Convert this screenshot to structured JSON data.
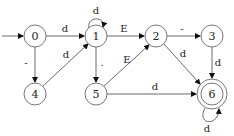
{
  "diagram": {
    "type": "finite-state-automaton",
    "start_state": "0",
    "accepting_states": [
      "6"
    ],
    "nodes": [
      {
        "id": "0",
        "label": "0",
        "x": 35,
        "y": 36
      },
      {
        "id": "1",
        "label": "1",
        "x": 96,
        "y": 36
      },
      {
        "id": "2",
        "label": "2",
        "x": 156,
        "y": 36
      },
      {
        "id": "3",
        "label": "3",
        "x": 212,
        "y": 36
      },
      {
        "id": "4",
        "label": "4",
        "x": 35,
        "y": 94
      },
      {
        "id": "5",
        "label": "5",
        "x": 96,
        "y": 94
      },
      {
        "id": "6",
        "label": "6",
        "x": 212,
        "y": 94
      }
    ],
    "edges": [
      {
        "from": "0",
        "to": "1",
        "label": "d"
      },
      {
        "from": "0",
        "to": "4",
        "label": "-"
      },
      {
        "from": "4",
        "to": "1",
        "label": "d"
      },
      {
        "from": "1",
        "to": "1",
        "label": "d"
      },
      {
        "from": "1",
        "to": "2",
        "label": "E"
      },
      {
        "from": "1",
        "to": "5",
        "label": "."
      },
      {
        "from": "5",
        "to": "2",
        "label": "E"
      },
      {
        "from": "5",
        "to": "6",
        "label": "d"
      },
      {
        "from": "2",
        "to": "3",
        "label": "-"
      },
      {
        "from": "2",
        "to": "6",
        "label": "d"
      },
      {
        "from": "3",
        "to": "6",
        "label": "d"
      },
      {
        "from": "6",
        "to": "6",
        "label": "d"
      }
    ]
  }
}
